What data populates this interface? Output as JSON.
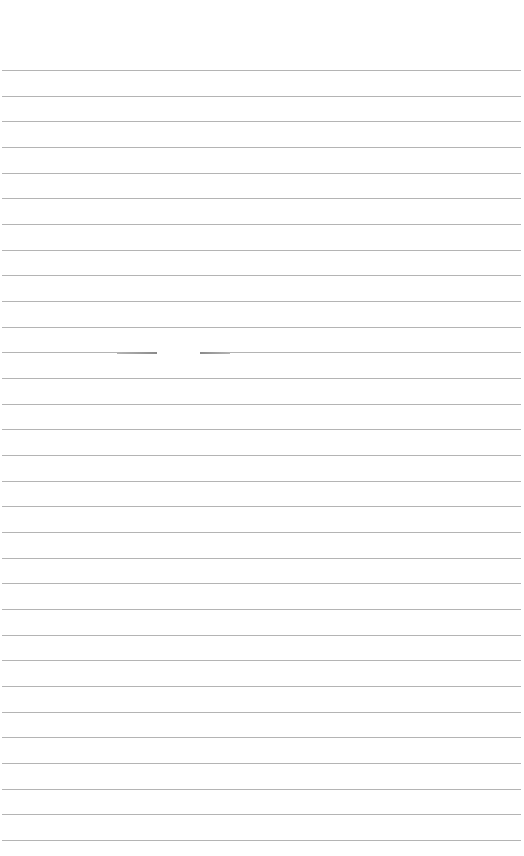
{
  "page": {
    "type": "lined-paper",
    "background_color": "#ffffff",
    "rule_color": "#b4b4b4",
    "rule_count": 31,
    "first_rule_y": 70,
    "rule_spacing": 25.67,
    "rule_left": 2,
    "rule_right": 521,
    "gap": {
      "line_index": 11,
      "x_start": 157,
      "x_end": 200
    }
  }
}
